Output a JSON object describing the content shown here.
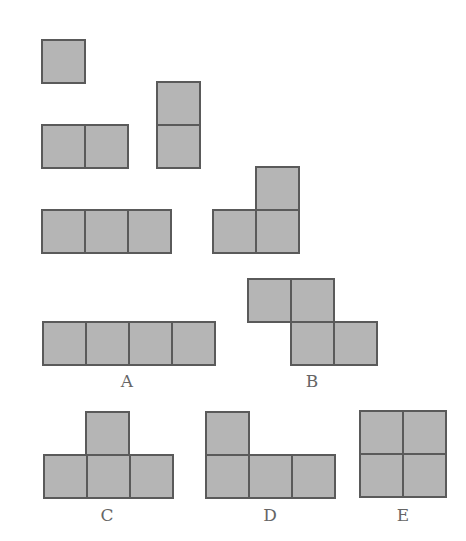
{
  "cell_size": 43,
  "colors": {
    "fill": "#b5b5b5",
    "border": "#5a5a5a",
    "label": "#666666"
  },
  "pieces": [
    {
      "name": "monomino",
      "label": "",
      "cells": [
        [
          41,
          39
        ]
      ]
    },
    {
      "name": "domino-horizontal",
      "label": "",
      "cells": [
        [
          41,
          124
        ],
        [
          84,
          124
        ]
      ]
    },
    {
      "name": "domino-vertical",
      "label": "",
      "cells": [
        [
          156,
          81
        ],
        [
          156,
          124
        ]
      ]
    },
    {
      "name": "tromino-straight",
      "label": "",
      "cells": [
        [
          41,
          209
        ],
        [
          84,
          209
        ],
        [
          127,
          209
        ]
      ]
    },
    {
      "name": "tromino-l",
      "label": "",
      "cells": [
        [
          255,
          166
        ],
        [
          212,
          209
        ],
        [
          255,
          209
        ]
      ]
    },
    {
      "name": "tetromino-a",
      "label": "A",
      "label_pos": [
        127,
        373
      ],
      "cells": [
        [
          42,
          321
        ],
        [
          85,
          321
        ],
        [
          128,
          321
        ],
        [
          171,
          321
        ]
      ]
    },
    {
      "name": "tetromino-b",
      "label": "B",
      "label_pos": [
        312,
        373
      ],
      "cells": [
        [
          247,
          278
        ],
        [
          290,
          278
        ],
        [
          290,
          321
        ],
        [
          333,
          321
        ]
      ]
    },
    {
      "name": "tetromino-c",
      "label": "C",
      "label_pos": [
        107,
        507
      ],
      "cells": [
        [
          85,
          411
        ],
        [
          43,
          454
        ],
        [
          86,
          454
        ],
        [
          129,
          454
        ]
      ]
    },
    {
      "name": "tetromino-d",
      "label": "D",
      "label_pos": [
        270,
        507
      ],
      "cells": [
        [
          205,
          411
        ],
        [
          205,
          454
        ],
        [
          248,
          454
        ],
        [
          291,
          454
        ]
      ]
    },
    {
      "name": "tetromino-e",
      "label": "E",
      "label_pos": [
        403,
        507
      ],
      "cells": [
        [
          359,
          410
        ],
        [
          402,
          410
        ],
        [
          359,
          453
        ],
        [
          402,
          453
        ]
      ]
    }
  ]
}
